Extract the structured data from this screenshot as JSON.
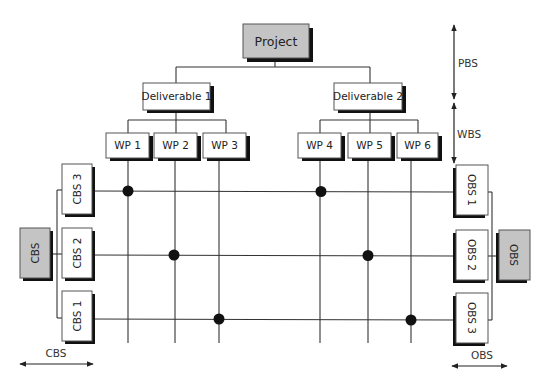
{
  "diagram": {
    "root": {
      "label": "Project",
      "color": "#c4c4c4"
    },
    "deliverables": [
      {
        "label": "Deliverable 1"
      },
      {
        "label": "Deliverable 2"
      }
    ],
    "work_packages": [
      {
        "label": "WP 1",
        "deliverable": "Deliverable 1"
      },
      {
        "label": "WP 2",
        "deliverable": "Deliverable 1"
      },
      {
        "label": "WP 3",
        "deliverable": "Deliverable 1"
      },
      {
        "label": "WP 4",
        "deliverable": "Deliverable 2"
      },
      {
        "label": "WP 5",
        "deliverable": "Deliverable 2"
      },
      {
        "label": "WP 6",
        "deliverable": "Deliverable 2"
      }
    ],
    "cbs": {
      "root_label": "CBS",
      "items": [
        {
          "label": "CBS 3"
        },
        {
          "label": "CBS 2"
        },
        {
          "label": "CBS 1"
        }
      ],
      "dimension_label": "CBS"
    },
    "obs": {
      "root_label": "OBS",
      "items": [
        {
          "label": "OBS 1"
        },
        {
          "label": "OBS 2"
        },
        {
          "label": "OBS 3"
        }
      ],
      "dimension_label": "OBS"
    },
    "levels": [
      {
        "label": "PBS"
      },
      {
        "label": "WBS"
      }
    ],
    "intersections": [
      {
        "row": "CBS 3 / OBS 1",
        "columns": [
          "WP 1",
          "WP 4"
        ]
      },
      {
        "row": "CBS 2 / OBS 2",
        "columns": [
          "WP 2",
          "WP 5"
        ]
      },
      {
        "row": "CBS 1 / OBS 3",
        "columns": [
          "WP 3",
          "WP 6"
        ]
      }
    ],
    "colors": {
      "gray_box": "#c4c4c4",
      "shadow": "#111111",
      "line": "#333333"
    }
  }
}
